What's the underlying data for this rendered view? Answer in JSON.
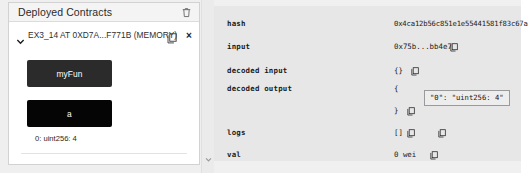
{
  "left_panel": {
    "title": "Deployed Contracts",
    "trash_icon": "trash-icon",
    "contract": {
      "caret_icon": "chevron-down-icon",
      "label": "EX3_14 AT 0XD7A...F771B (MEMORY)",
      "copy_icon": "copy-icon",
      "close_icon": "×"
    },
    "functions": [
      {
        "label": "myFun",
        "kind": "transact"
      },
      {
        "label": "a",
        "kind": "call"
      }
    ],
    "result": "0: uint256: 4",
    "gutter_icon": "chevron-down-icon"
  },
  "terminal": {
    "rows": [
      {
        "key": "hash",
        "value": "0x4ca12b56c851e1e55441581f83c67a",
        "copy": false
      },
      {
        "key": "input",
        "value": "0x75b...bb4e7",
        "copy": true
      },
      {
        "key": "decoded input",
        "value": "{}",
        "copy": true
      },
      {
        "key": "decoded output",
        "value": "{",
        "copy": false
      },
      {
        "key": "logs",
        "value": "[]",
        "copy": true
      },
      {
        "key": "val",
        "value": "0 wei",
        "copy": true
      }
    ],
    "decoded_output_open": "{",
    "decoded_output_close": "}",
    "tooltip": "\"0\": \"uint256: 4\""
  }
}
